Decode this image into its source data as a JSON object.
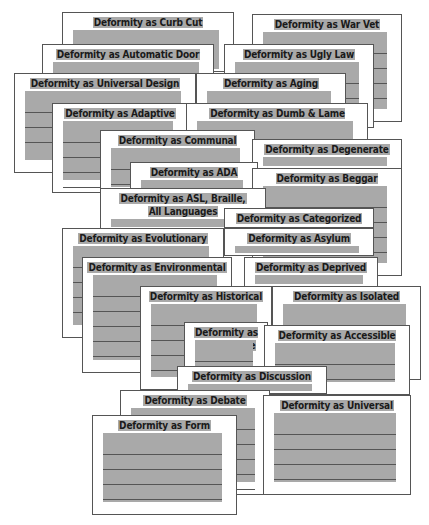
{
  "collage": {
    "background": "#ffffff",
    "card_fill": "#a9a9a9",
    "card_border": "#555555",
    "cards": [
      {
        "id": "curb-cut",
        "title": "Deformity as Curb Cut",
        "x": 62,
        "y": 12,
        "w": 172,
        "h": 60,
        "lines": 0
      },
      {
        "id": "war-vet",
        "title": "Deformity as War Vet",
        "x": 252,
        "y": 14,
        "w": 150,
        "h": 108,
        "lines": 4
      },
      {
        "id": "automatic-door",
        "title": "Deformity as Automatic Door",
        "x": 42,
        "y": 44,
        "w": 172,
        "h": 40,
        "lines": 0
      },
      {
        "id": "ugly-law",
        "title": "Deformity as Ugly Law",
        "x": 224,
        "y": 44,
        "w": 150,
        "h": 84,
        "lines": 3
      },
      {
        "id": "universal-design",
        "title": "Deformity as Universal Design",
        "x": 14,
        "y": 73,
        "w": 182,
        "h": 100,
        "lines": 3
      },
      {
        "id": "aging",
        "title": "Deformity as Aging",
        "x": 196,
        "y": 73,
        "w": 150,
        "h": 40,
        "lines": 0
      },
      {
        "id": "adaptive",
        "title": "Deformity as Adaptive",
        "x": 52,
        "y": 103,
        "w": 136,
        "h": 90,
        "lines": 4
      },
      {
        "id": "dumb-lame-metaphors",
        "title": "Deformity as Dumb & Lame Metaphors",
        "x": 186,
        "y": 103,
        "w": 182,
        "h": 40,
        "lines": 0
      },
      {
        "id": "communal",
        "title": "Deformity as Communal",
        "x": 100,
        "y": 130,
        "w": 155,
        "h": 70,
        "lines": 2
      },
      {
        "id": "degenerate",
        "title": "Deformity as Degenerate",
        "x": 252,
        "y": 139,
        "w": 150,
        "h": 30,
        "lines": 0
      },
      {
        "id": "adaa",
        "title": "Deformity as ADA",
        "x": 130,
        "y": 162,
        "w": 128,
        "h": 30,
        "lines": 0
      },
      {
        "id": "beggar",
        "title": "Deformity as Beggar",
        "x": 252,
        "y": 168,
        "w": 150,
        "h": 108,
        "lines": 4
      },
      {
        "id": "asl-braille",
        "title": "Deformity as ASL, Braille,\nAll Languages",
        "x": 100,
        "y": 188,
        "w": 166,
        "h": 42,
        "lines": 0
      },
      {
        "id": "categorized",
        "title": "Deformity as Categorized",
        "x": 224,
        "y": 208,
        "w": 150,
        "h": 20,
        "lines": 0
      },
      {
        "id": "evolutionary",
        "title": "Deformity as Evolutionary",
        "x": 62,
        "y": 228,
        "w": 162,
        "h": 110,
        "lines": 4
      },
      {
        "id": "asylum",
        "title": "Deformity as Asylum",
        "x": 224,
        "y": 228,
        "w": 150,
        "h": 28,
        "lines": 0
      },
      {
        "id": "environmental",
        "title": "Deformity as Environmental",
        "x": 82,
        "y": 257,
        "w": 150,
        "h": 116,
        "lines": 5
      },
      {
        "id": "deprived",
        "title": "Deformity as Deprived",
        "x": 244,
        "y": 257,
        "w": 134,
        "h": 30,
        "lines": 0
      },
      {
        "id": "historical",
        "title": "Deformity as Historical",
        "x": 140,
        "y": 286,
        "w": 132,
        "h": 104,
        "lines": 4
      },
      {
        "id": "isolated",
        "title": "Deformity as Isolated",
        "x": 272,
        "y": 286,
        "w": 149,
        "h": 94,
        "lines": 2
      },
      {
        "id": "inaccessible",
        "title": "Deformity as Inaccessible",
        "x": 184,
        "y": 322,
        "w": 84,
        "h": 70,
        "lines": 1
      },
      {
        "id": "accessible",
        "title": "Deformity as Accessible",
        "x": 264,
        "y": 325,
        "w": 146,
        "h": 70,
        "lines": 3
      },
      {
        "id": "discussion",
        "title": "Deformity as Discussion",
        "x": 177,
        "y": 366,
        "w": 150,
        "h": 28,
        "lines": 0
      },
      {
        "id": "debate",
        "title": "Deformity as Debate",
        "x": 120,
        "y": 390,
        "w": 150,
        "h": 105,
        "lines": 5
      },
      {
        "id": "universal",
        "title": "Deformity as Universal",
        "x": 263,
        "y": 395,
        "w": 148,
        "h": 100,
        "lines": 4
      },
      {
        "id": "form",
        "title": "Deformity as Form",
        "x": 92,
        "y": 415,
        "w": 145,
        "h": 100,
        "lines": 5
      }
    ]
  }
}
